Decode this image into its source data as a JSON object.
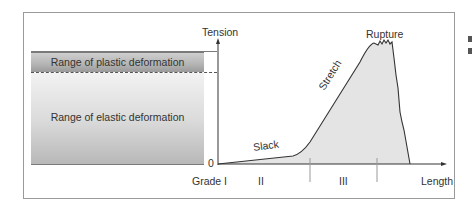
{
  "diagram": {
    "y_axis_label": "Tension",
    "x_axis_label": "Length",
    "origin_label": "0",
    "ranges": {
      "plastic": "Range of plastic deformation",
      "elastic": "Range of elastic deformation"
    },
    "curve_labels": {
      "slack": "Slack",
      "stretch": "Stretch",
      "rupture": "Rupture"
    },
    "grades": [
      "Grade I",
      "II",
      "III"
    ],
    "colors": {
      "curve_line": "#333333",
      "curve_fill": "#e4e4e4",
      "axis": "#333333",
      "frame": "#9a9a9a"
    }
  }
}
